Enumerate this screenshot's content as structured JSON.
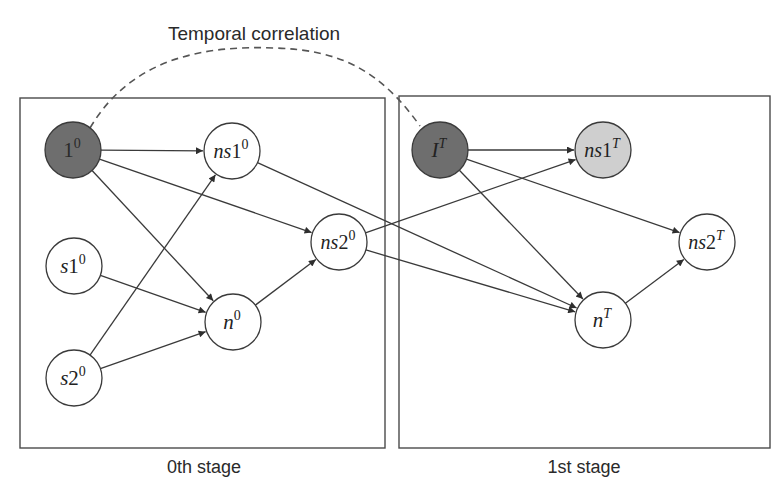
{
  "title": "Temporal correlation",
  "stages": [
    {
      "label": "0th stage",
      "box": {
        "x": 20,
        "y": 98,
        "w": 365,
        "h": 350
      }
    },
    {
      "label": "1st stage",
      "box": {
        "x": 399,
        "y": 96,
        "w": 371,
        "h": 352
      }
    }
  ],
  "colors": {
    "dark_node": "#6e6e6e",
    "light_node": "#cfcfcf",
    "white_node": "#ffffff",
    "stroke": "#3a3a3a"
  },
  "nodes": [
    {
      "id": "1_0",
      "base": "1",
      "sup": "0",
      "italic": false,
      "x": 73,
      "y": 150,
      "fill": "dark"
    },
    {
      "id": "ns1_0",
      "base": "ns1",
      "sup": "0",
      "italic": true,
      "x": 232,
      "y": 151,
      "fill": "white"
    },
    {
      "id": "ns2_0",
      "base": "ns2",
      "sup": "0",
      "italic": true,
      "x": 339,
      "y": 242,
      "fill": "white"
    },
    {
      "id": "s1_0",
      "base": "s1",
      "sup": "0",
      "italic": true,
      "x": 74,
      "y": 266,
      "fill": "white"
    },
    {
      "id": "n_0",
      "base": "n",
      "sup": "0",
      "italic": true,
      "x": 233,
      "y": 322,
      "fill": "white"
    },
    {
      "id": "s2_0",
      "base": "s2",
      "sup": "0",
      "italic": true,
      "x": 74,
      "y": 378,
      "fill": "white"
    },
    {
      "id": "I_T",
      "base": "I",
      "sup": "T",
      "italic": true,
      "x": 440,
      "y": 150,
      "fill": "dark"
    },
    {
      "id": "ns1_T",
      "base": "ns1",
      "sup": "T",
      "italic": true,
      "x": 603,
      "y": 150,
      "fill": "light"
    },
    {
      "id": "ns2_T",
      "base": "ns2",
      "sup": "T",
      "italic": true,
      "x": 707,
      "y": 242,
      "fill": "white"
    },
    {
      "id": "n_T",
      "base": "n",
      "sup": "T",
      "italic": true,
      "x": 603,
      "y": 320,
      "fill": "white"
    }
  ],
  "edges": [
    {
      "from": "1_0",
      "to": "ns1_0"
    },
    {
      "from": "1_0",
      "to": "ns2_0"
    },
    {
      "from": "1_0",
      "to": "n_0"
    },
    {
      "from": "s1_0",
      "to": "n_0"
    },
    {
      "from": "s2_0",
      "to": "n_0"
    },
    {
      "from": "s2_0",
      "to": "ns1_0"
    },
    {
      "from": "n_0",
      "to": "ns2_0"
    },
    {
      "from": "ns1_0",
      "to": "n_T"
    },
    {
      "from": "ns2_0",
      "to": "n_T"
    },
    {
      "from": "ns2_0",
      "to": "ns1_T"
    },
    {
      "from": "I_T",
      "to": "ns1_T"
    },
    {
      "from": "I_T",
      "to": "ns2_T"
    },
    {
      "from": "I_T",
      "to": "n_T"
    },
    {
      "from": "n_T",
      "to": "ns2_T"
    }
  ],
  "temporal_link": {
    "from": "1_0",
    "to": "I_T",
    "style": "dashed"
  },
  "node_radius": 28
}
